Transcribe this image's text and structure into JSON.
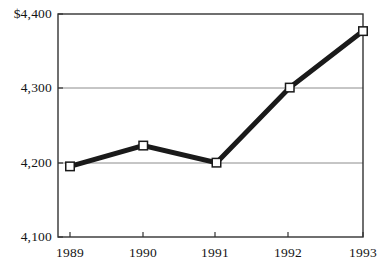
{
  "chart_data": {
    "type": "line",
    "title": "",
    "subtitle": "",
    "xlabel": "",
    "ylabel": "",
    "categories": [
      "1989",
      "1990",
      "1991",
      "1992",
      "1993"
    ],
    "values": [
      4195,
      4223,
      4200,
      4301,
      4377
    ],
    "series": [
      {
        "name": "",
        "values": [
          4195,
          4223,
          4200,
          4301,
          4377
        ]
      }
    ],
    "ylim": [
      4100,
      4400
    ],
    "y_ticks": [
      4100,
      4200,
      4300,
      4400
    ],
    "y_tick_labels": [
      "4,100",
      "4,200",
      "4,300",
      "$4,400"
    ],
    "x_tick_labels": [
      "1989",
      "1990",
      "1991",
      "1992",
      "1993"
    ],
    "grid": true,
    "gridlines_at": [
      4200,
      4300
    ],
    "legend": false,
    "legend_position": "none",
    "annotations": [],
    "marker": "open-square",
    "colors": {
      "line": "#1a1a1a",
      "marker_fill": "#ffffff",
      "marker_stroke": "#1a1a1a",
      "gridline": "#8c8c8c",
      "frame": "#333333",
      "text": "#141414",
      "background": "#ffffff"
    }
  }
}
